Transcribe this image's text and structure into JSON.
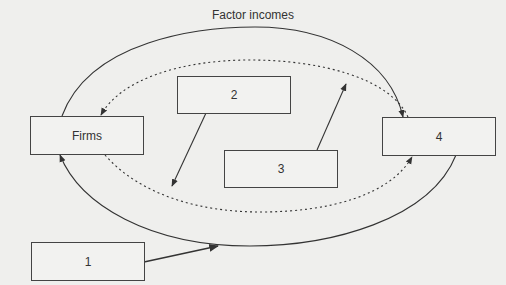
{
  "diagram": {
    "title": "Factor incomes",
    "nodes": {
      "firms": "Firms",
      "box1": "1",
      "box2": "2",
      "box3": "3",
      "box4": "4"
    },
    "colors": {
      "background": "#efefed",
      "stroke": "#333333"
    }
  }
}
